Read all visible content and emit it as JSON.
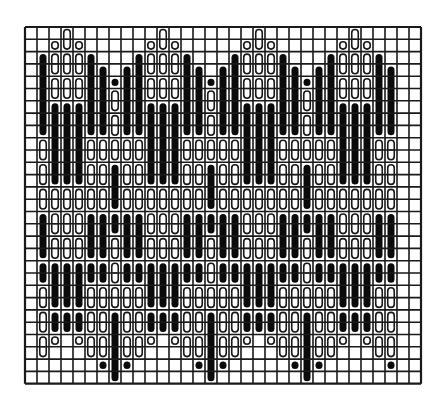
{
  "grid": {
    "origin_x": 25,
    "origin_y": 27,
    "columns": 33,
    "rows": 29,
    "cell_width": 12.0,
    "cell_height": 12.3,
    "line_color": "#1a1a1a",
    "line_width": 1.6,
    "border_width": 2.2,
    "background": "#ffffff"
  },
  "stitches": {
    "first_column": 1,
    "last_column": 30,
    "repeat_width": 8,
    "peak_column": 3,
    "column_span_rows": 25,
    "solid_color": "#0a0a0a",
    "outline_color": "#1a1a1a",
    "outline_fill": "#ffffff",
    "sequence": [
      {
        "len": 2,
        "type": "solid"
      },
      {
        "len": 2,
        "type": "outline"
      },
      {
        "len": 2,
        "type": "outline"
      },
      {
        "len": 2,
        "type": "outline"
      },
      {
        "len": 7,
        "type": "solid"
      },
      {
        "len": 2,
        "type": "outline"
      },
      {
        "len": 2,
        "type": "outline"
      },
      {
        "len": 2,
        "type": "outline"
      },
      {
        "len": 4,
        "type": "solid"
      }
    ],
    "top_peaks_columns": [
      3,
      11,
      19,
      27
    ],
    "bottom_valley_columns": [
      7,
      15,
      23
    ]
  }
}
